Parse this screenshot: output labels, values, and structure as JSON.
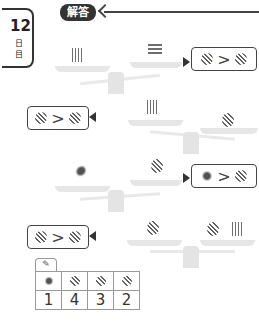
{
  "day_tab": {
    "number": "12",
    "kanji_1": "日",
    "kanji_2": "目"
  },
  "header": {
    "badge_label": "解答"
  },
  "answers": [
    {
      "left": "obfuscated-shape-a",
      "op": ">",
      "right": "obfuscated-shape-b"
    },
    {
      "left": "obfuscated-shape-c",
      "op": ">",
      "right": "obfuscated-shape-a"
    },
    {
      "left": "obfuscated-shape-d",
      "op": ">",
      "right": "obfuscated-shape-c"
    },
    {
      "left": "obfuscated-shape-b",
      "op": ">",
      "right": "obfuscated-shape-a"
    }
  ],
  "result_table": {
    "icon": "pencil-icon",
    "headers": [
      "shape-1",
      "shape-2",
      "shape-3",
      "shape-4"
    ],
    "values": [
      "1",
      "4",
      "3",
      "2"
    ]
  }
}
